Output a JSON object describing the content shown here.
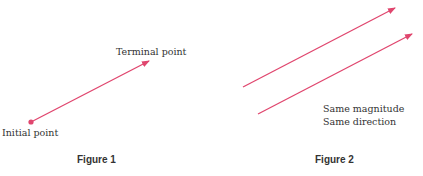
{
  "figure1": {
    "caption": "Figure 1",
    "terminal_label": "Terminal point",
    "initial_label": "Initial point",
    "vector": {
      "x1": 31,
      "y1": 122,
      "x2": 149,
      "y2": 61
    }
  },
  "figure2": {
    "caption": "Figure 2",
    "annotation_line1": "Same magnitude",
    "annotation_line2": "Same direction",
    "vectors": [
      {
        "x1": 243,
        "y1": 87,
        "x2": 395,
        "y2": 8
      },
      {
        "x1": 258,
        "y1": 114,
        "x2": 412,
        "y2": 34
      }
    ]
  },
  "colors": {
    "vector": "#e0466e",
    "text": "#333333"
  }
}
